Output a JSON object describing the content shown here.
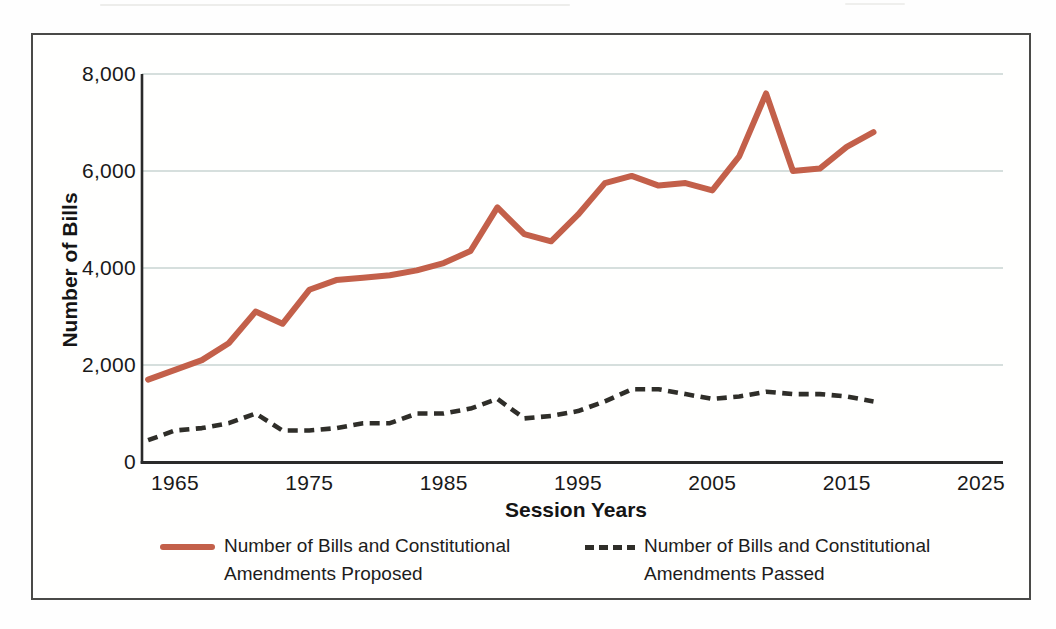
{
  "figure": {
    "background": "#fffffe",
    "border_color": "#4a4a48"
  },
  "chart_data": {
    "type": "line",
    "title": "",
    "xlabel": "Session Years",
    "ylabel": "Number of Bills",
    "x": [
      1963,
      1965,
      1967,
      1969,
      1971,
      1973,
      1975,
      1977,
      1979,
      1981,
      1983,
      1985,
      1987,
      1989,
      1991,
      1993,
      1995,
      1997,
      1999,
      2001,
      2003,
      2005,
      2007,
      2009,
      2011,
      2013,
      2015,
      2017
    ],
    "series": [
      {
        "name": "Number of Bills and Constitutional Amendments Proposed",
        "style": "solid",
        "color": "#c3604a",
        "values": [
          1700,
          1900,
          2100,
          2450,
          3100,
          2850,
          3550,
          3750,
          3800,
          3850,
          3950,
          4100,
          4350,
          5250,
          4700,
          4550,
          5100,
          5750,
          5900,
          5700,
          5750,
          5600,
          6300,
          7600,
          6000,
          6050,
          6500,
          6800
        ]
      },
      {
        "name": "Number of Bills and Constitutional Amendments Passed",
        "style": "dashed",
        "color": "#2f2e29",
        "values": [
          450,
          650,
          700,
          800,
          1000,
          650,
          650,
          700,
          800,
          800,
          1000,
          1000,
          1100,
          1300,
          900,
          950,
          1050,
          1250,
          1500,
          1500,
          1400,
          1300,
          1350,
          1450,
          1400,
          1400,
          1350,
          1250
        ]
      }
    ],
    "xticks": {
      "values": [
        1965,
        1975,
        1985,
        1995,
        2005,
        2015,
        2025
      ],
      "labels": [
        "1965",
        "1975",
        "1985",
        "1995",
        "2005",
        "2015",
        "2025"
      ]
    },
    "yticks": {
      "values": [
        0,
        2000,
        4000,
        6000,
        8000
      ],
      "labels": [
        "0",
        "2,000",
        "4,000",
        "6,000",
        "8,000"
      ]
    },
    "ylim": [
      0,
      8000
    ],
    "xlim": [
      1962.5,
      2026.6
    ],
    "grid": "horizontal gridlines at each y tick",
    "gridline_color": "#c9d4d2",
    "axis_color": "#2a2a2a",
    "legend_position": "bottom",
    "legend": [
      {
        "line1": "Number of Bills and Constitutional",
        "line2": "Amendments Proposed"
      },
      {
        "line1": "Number of Bills and Constitutional",
        "line2": "Amendments Passed"
      }
    ]
  }
}
